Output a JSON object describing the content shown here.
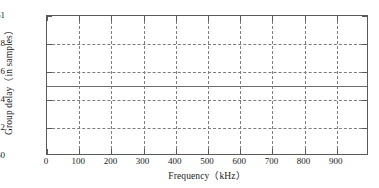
{
  "chart_data": {
    "type": "line",
    "title": "",
    "xlabel": "Frequency（kHz）",
    "ylabel": "Group delay（in samples）",
    "xlim": [
      0,
      1000
    ],
    "ylim": [
      60,
      61
    ],
    "grid": true,
    "legend": null,
    "x_ticks": [
      0,
      100,
      200,
      300,
      400,
      500,
      600,
      700,
      800,
      900,
      1000
    ],
    "x_tick_labels": [
      "0",
      "100",
      "200",
      "300",
      "400",
      "500",
      "600",
      "700",
      "800",
      "900",
      ""
    ],
    "y_ticks": [
      60,
      60.2,
      60.4,
      60.6,
      60.8,
      61
    ],
    "y_tick_labels": [
      "60",
      "60.2",
      "60.4",
      "60.6",
      "60.8",
      "61"
    ],
    "y_gridlines": [
      60.2,
      60.4,
      60.6,
      60.8
    ],
    "x_gridlines": [
      100,
      200,
      300,
      400,
      500,
      600,
      700,
      800,
      900
    ],
    "series": [
      {
        "name": "Group delay",
        "color": "#6d6d6d",
        "style": "solid",
        "x": [
          0,
          100,
          200,
          300,
          400,
          500,
          600,
          700,
          800,
          900,
          1000
        ],
        "values": [
          60.5,
          60.5,
          60.5,
          60.5,
          60.5,
          60.5,
          60.5,
          60.5,
          60.5,
          60.5,
          60.5
        ]
      }
    ]
  },
  "axes": {
    "frame_color": "#5a5a5a",
    "grid_color": "#7d7d7d"
  }
}
